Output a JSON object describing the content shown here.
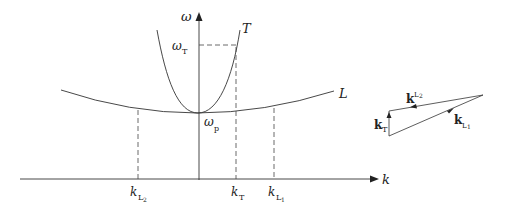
{
  "diagram": {
    "type": "dispersion-relation",
    "axes": {
      "x_label": "k",
      "y_label": "ω"
    },
    "curves": [
      {
        "name": "T",
        "label": "T",
        "description": "transverse wave branch, steep parabola"
      },
      {
        "name": "L",
        "label": "L",
        "description": "longitudinal wave branch, shallow parabola"
      }
    ],
    "points": {
      "omega_p": {
        "base": "ω",
        "sub": "p"
      },
      "omega_T": {
        "base": "ω",
        "sub": "T"
      }
    },
    "k_ticks": [
      {
        "base": "k",
        "sub": "L₂",
        "sub_main": "L",
        "sub_idx": "2"
      },
      {
        "base": "k",
        "sub": "T",
        "sub_main": "T",
        "sub_idx": ""
      },
      {
        "base": "k",
        "sub": "L₁",
        "sub_main": "L",
        "sub_idx": "1"
      }
    ],
    "vector_triangle": {
      "vectors": [
        {
          "name": "k_L2",
          "base": "k",
          "sub_main": "L",
          "sub_idx": "2"
        },
        {
          "name": "k_T",
          "base": "k",
          "sub_main": "T",
          "sub_idx": ""
        },
        {
          "name": "k_L1",
          "base": "k",
          "sub_main": "L",
          "sub_idx": "1"
        }
      ]
    },
    "colors": {
      "line": "#333333",
      "text": "#222222",
      "background": "#ffffff"
    }
  }
}
